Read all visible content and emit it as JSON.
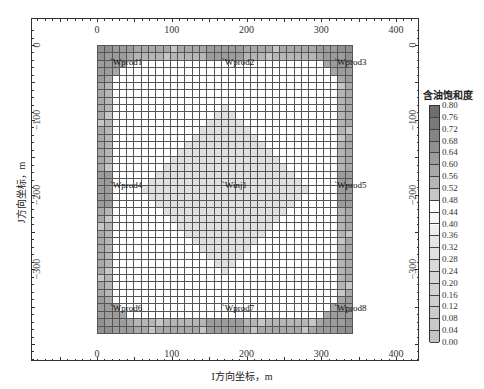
{
  "chart_data": {
    "type": "heatmap",
    "title": "",
    "xlabel": "I方向坐标，m",
    "ylabel": "J方向坐标，m",
    "xlim": [
      -90,
      430
    ],
    "ylim": [
      -375,
      30
    ],
    "x_ticks_top": [
      0,
      100,
      200,
      300,
      400
    ],
    "x_ticks_bottom": [
      0,
      100,
      200,
      300,
      400
    ],
    "y_ticks_left": [
      0,
      -100,
      -200,
      -300
    ],
    "y_ticks_right": [
      0,
      -100,
      -200,
      -300
    ],
    "grid": {
      "cols": 35,
      "rows": 39,
      "x_extent": [
        0,
        350
      ],
      "y_extent": [
        0,
        -385
      ]
    },
    "colorbar": {
      "title": "含油饱和度",
      "labels": [
        "0.80",
        "0.76",
        "0.72",
        "0.68",
        "0.64",
        "0.60",
        "0.56",
        "0.52",
        "0.48",
        "0.44",
        "0.40",
        "0.36",
        "0.32",
        "0.28",
        "0.24",
        "0.20",
        "0.16",
        "0.12",
        "0.08",
        "0.04",
        "0.00"
      ],
      "colors": [
        "#6e6e6e",
        "#7a7a7a",
        "#858585",
        "#909090",
        "#9c9c9c",
        "#a8a8a8",
        "#b6b6b6",
        "#c6c6c6",
        "#ffffff",
        "#f6f6f6",
        "#eeeeee",
        "#e6e6e6",
        "#e0e0e0",
        "#dadada",
        "#d6d6d6",
        "#d2d2d2",
        "#cecece",
        "#cbcbcb",
        "#c8c8c8",
        "#c4c4c4"
      ]
    },
    "wells": [
      {
        "name": "Wprod1",
        "x": 25,
        "y": -25
      },
      {
        "name": "Wprod2",
        "x": 175,
        "y": -25
      },
      {
        "name": "Wprod3",
        "x": 325,
        "y": -25
      },
      {
        "name": "Wprod4",
        "x": 25,
        "y": -190
      },
      {
        "name": "Winj1",
        "x": 175,
        "y": -190
      },
      {
        "name": "Wprod5",
        "x": 325,
        "y": -190
      },
      {
        "name": "Wprod6",
        "x": 25,
        "y": -355
      },
      {
        "name": "Wprod7",
        "x": 175,
        "y": -355
      },
      {
        "name": "Wprod8",
        "x": 325,
        "y": -355
      }
    ],
    "pattern": {
      "injector_diamond_radius_cells": 11,
      "diamond_saturation": 0.3,
      "background_saturation": 0.48,
      "edge_saturation": 0.6,
      "corner_saturation": 0.68
    }
  }
}
